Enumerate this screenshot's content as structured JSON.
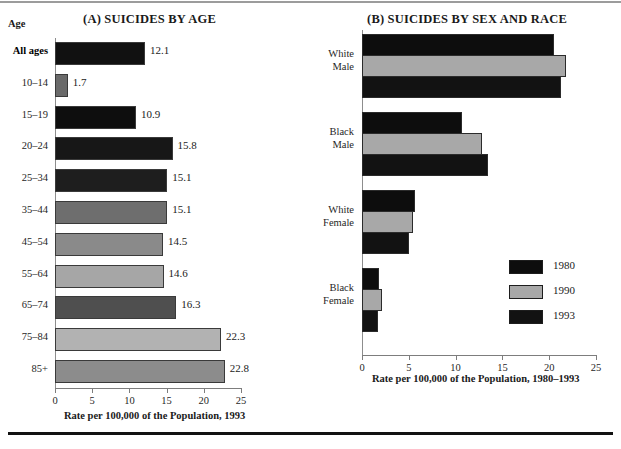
{
  "figure": {
    "top_rule": true,
    "bottom_rule": true
  },
  "panel_a": {
    "title": "(A) SUICIDES BY AGE",
    "age_header": "Age",
    "axis_caption": "Rate per 100,000 of the Population, 1993"
  },
  "panel_b": {
    "title": "(B) SUICIDES BY SEX AND RACE",
    "axis_caption": "Rate per 100,000 of the Population, 1980–1993"
  },
  "legend": {
    "items": [
      {
        "label": "1980",
        "color": "#0d0d0d"
      },
      {
        "label": "1990",
        "color": "#a8a8a8"
      },
      {
        "label": "1993",
        "color": "#121212"
      }
    ]
  },
  "chart_data": [
    {
      "type": "bar",
      "orientation": "horizontal",
      "title": "(A) SUICIDES BY AGE",
      "xlabel": "Rate per 100,000 of the Population, 1993",
      "ylabel": "Age",
      "xlim": [
        0,
        25
      ],
      "xticks": [
        0,
        5,
        10,
        15,
        20,
        25
      ],
      "grid": false,
      "legend": "none",
      "categories": [
        "All ages",
        "10–14",
        "15–19",
        "20–24",
        "25–34",
        "35–44",
        "45–54",
        "55–64",
        "65–74",
        "75–84",
        "85+"
      ],
      "values": [
        12.1,
        1.7,
        10.9,
        15.8,
        15.1,
        15.1,
        14.5,
        14.6,
        16.3,
        22.3,
        22.8
      ],
      "value_labels": [
        "12.1",
        "1.7",
        "10.9",
        "15.8",
        "15.1",
        "15.1",
        "14.5",
        "14.6",
        "16.3",
        "22.3",
        "22.8"
      ],
      "bar_colors": [
        "#111111",
        "#6a6a6a",
        "#0e0e0e",
        "#171717",
        "#1e1e1e",
        "#6e6e6e",
        "#8a8a8a",
        "#a6a6a6",
        "#4f4f4f",
        "#b2b2b2",
        "#8c8c8c"
      ],
      "bold_categories": [
        "All ages"
      ]
    },
    {
      "type": "bar",
      "orientation": "horizontal",
      "grouped": true,
      "title": "(B) SUICIDES BY SEX AND RACE",
      "xlabel": "Rate per 100,000 of the Population, 1980–1993",
      "ylabel": "",
      "xlim": [
        0,
        25
      ],
      "xticks": [
        0,
        5,
        10,
        15,
        20,
        25
      ],
      "grid": false,
      "legend": "right",
      "categories": [
        "White Male",
        "Black Male",
        "White Female",
        "Black Female"
      ],
      "category_lines": [
        [
          "White",
          "Male"
        ],
        [
          "Black",
          "Male"
        ],
        [
          "White",
          "Female"
        ],
        [
          "Black",
          "Female"
        ]
      ],
      "series": [
        {
          "name": "1980",
          "color": "#0d0d0d",
          "values": [
            20.5,
            10.7,
            5.7,
            1.8
          ]
        },
        {
          "name": "1990",
          "color": "#a8a8a8",
          "values": [
            21.8,
            12.8,
            5.4,
            2.1
          ]
        },
        {
          "name": "1993",
          "color": "#121212",
          "values": [
            21.3,
            13.5,
            5.0,
            1.7
          ]
        }
      ]
    }
  ]
}
